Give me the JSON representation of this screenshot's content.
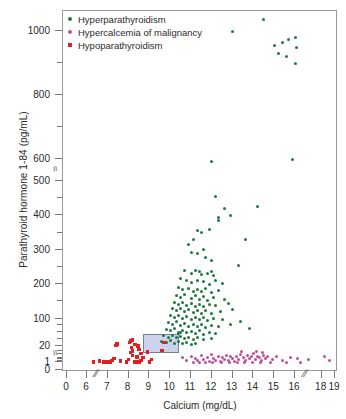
{
  "chart_data": {
    "type": "scatter",
    "title": "",
    "xlabel": "Calcium (mg/dL)",
    "ylabel": "Parathyroid hormone 1-84 (pg/mL)",
    "grid": false,
    "legend_position": "top-left",
    "xlim": [
      0,
      19
    ],
    "ylim": [
      0,
      1000
    ],
    "x_ticklabels": [
      "0",
      "6",
      "7",
      "8",
      "9",
      "10",
      "11",
      "12",
      "13",
      "14",
      "15",
      "16",
      "18",
      "19"
    ],
    "x_tickvalues": [
      0,
      6,
      7,
      8,
      9,
      10,
      11,
      12,
      13,
      14,
      15,
      16,
      18,
      19
    ],
    "x_axis_break_after": 6,
    "x_axis_break_after_2": 16,
    "y_ticklabels": [
      "1000",
      "800",
      "600",
      "500",
      "400",
      "300",
      "200",
      "100",
      "20",
      "1",
      "0"
    ],
    "y_tickvalues": [
      1000,
      800,
      600,
      500,
      400,
      300,
      200,
      100,
      20,
      1,
      0
    ],
    "y_axis_break_between": "500-600",
    "y_axis_break_between_2": "1-20",
    "reference_box": {
      "label": "normal reference range",
      "x_range": [
        8.7,
        10.4
      ],
      "y_range": [
        12,
        55
      ],
      "fill": "#ccd2ea",
      "stroke": "#7a7f95"
    },
    "series": [
      {
        "name": "Hyperparathyroidism",
        "color": "#1f7a3d",
        "marker": "circle",
        "points": [
          [
            13.0,
            1000
          ],
          [
            14.5,
            1035
          ],
          [
            15.4,
            965
          ],
          [
            15.6,
            920
          ],
          [
            15.7,
            975
          ],
          [
            15.0,
            955
          ],
          [
            15.2,
            930
          ],
          [
            16.0,
            980
          ],
          [
            16.1,
            950
          ],
          [
            16.0,
            900
          ],
          [
            12.0,
            590
          ],
          [
            15.9,
            600
          ],
          [
            12.2,
            455
          ],
          [
            12.6,
            420
          ],
          [
            12.3,
            395
          ],
          [
            12.3,
            385
          ],
          [
            12.9,
            400
          ],
          [
            14.2,
            425
          ],
          [
            11.3,
            355
          ],
          [
            11.5,
            350
          ],
          [
            11.9,
            360
          ],
          [
            11.1,
            330
          ],
          [
            13.6,
            330
          ],
          [
            10.9,
            315
          ],
          [
            11.0,
            292
          ],
          [
            11.3,
            288
          ],
          [
            11.6,
            300
          ],
          [
            11.7,
            278
          ],
          [
            12.0,
            268
          ],
          [
            13.3,
            255
          ],
          [
            10.7,
            240
          ],
          [
            11.0,
            232
          ],
          [
            11.2,
            240
          ],
          [
            11.4,
            236
          ],
          [
            11.5,
            228
          ],
          [
            11.8,
            230
          ],
          [
            12.0,
            238
          ],
          [
            12.1,
            225
          ],
          [
            10.5,
            215
          ],
          [
            10.8,
            210
          ],
          [
            11.0,
            205
          ],
          [
            11.3,
            212
          ],
          [
            11.6,
            208
          ],
          [
            11.9,
            200
          ],
          [
            12.2,
            210
          ],
          [
            12.5,
            202
          ],
          [
            10.4,
            190
          ],
          [
            10.6,
            185
          ],
          [
            10.9,
            188
          ],
          [
            11.1,
            180
          ],
          [
            11.3,
            184
          ],
          [
            11.5,
            178
          ],
          [
            11.7,
            186
          ],
          [
            12.0,
            176
          ],
          [
            12.3,
            182
          ],
          [
            10.3,
            168
          ],
          [
            10.5,
            162
          ],
          [
            10.7,
            170
          ],
          [
            11.0,
            158
          ],
          [
            11.2,
            166
          ],
          [
            11.4,
            155
          ],
          [
            11.6,
            164
          ],
          [
            11.8,
            152
          ],
          [
            12.1,
            160
          ],
          [
            12.6,
            156
          ],
          [
            10.2,
            148
          ],
          [
            10.4,
            142
          ],
          [
            10.6,
            146
          ],
          [
            10.8,
            138
          ],
          [
            11.0,
            144
          ],
          [
            11.2,
            136
          ],
          [
            11.4,
            140
          ],
          [
            11.6,
            134
          ],
          [
            11.9,
            142
          ],
          [
            12.2,
            138
          ],
          [
            12.8,
            145
          ],
          [
            10.1,
            128
          ],
          [
            10.3,
            124
          ],
          [
            10.5,
            130
          ],
          [
            10.7,
            120
          ],
          [
            10.9,
            126
          ],
          [
            11.1,
            118
          ],
          [
            11.3,
            122
          ],
          [
            11.5,
            116
          ],
          [
            11.7,
            124
          ],
          [
            12.0,
            114
          ],
          [
            12.4,
            120
          ],
          [
            13.0,
            126
          ],
          [
            10.0,
            108
          ],
          [
            10.2,
            104
          ],
          [
            10.4,
            110
          ],
          [
            10.6,
            100
          ],
          [
            10.8,
            106
          ],
          [
            11.0,
            98
          ],
          [
            11.2,
            102
          ],
          [
            11.4,
            96
          ],
          [
            11.6,
            104
          ],
          [
            11.8,
            94
          ],
          [
            12.1,
            100
          ],
          [
            12.5,
            96
          ],
          [
            9.9,
            88
          ],
          [
            10.1,
            84
          ],
          [
            10.3,
            90
          ],
          [
            10.5,
            80
          ],
          [
            10.7,
            86
          ],
          [
            10.9,
            78
          ],
          [
            11.1,
            82
          ],
          [
            11.3,
            76
          ],
          [
            11.5,
            84
          ],
          [
            11.7,
            74
          ],
          [
            12.0,
            80
          ],
          [
            12.3,
            76
          ],
          [
            12.9,
            82
          ],
          [
            9.8,
            68
          ],
          [
            10.0,
            64
          ],
          [
            10.2,
            70
          ],
          [
            10.4,
            60
          ],
          [
            10.6,
            66
          ],
          [
            10.8,
            58
          ],
          [
            11.0,
            62
          ],
          [
            11.2,
            56
          ],
          [
            11.4,
            64
          ],
          [
            11.6,
            54
          ],
          [
            11.9,
            60
          ],
          [
            12.2,
            56
          ],
          [
            9.7,
            50
          ],
          [
            9.9,
            46
          ],
          [
            10.1,
            52
          ],
          [
            10.3,
            44
          ],
          [
            10.5,
            48
          ],
          [
            10.7,
            42
          ],
          [
            10.9,
            46
          ],
          [
            11.1,
            40
          ],
          [
            11.3,
            44
          ],
          [
            11.6,
            38
          ],
          [
            12.0,
            42
          ],
          [
            9.6,
            34
          ],
          [
            9.8,
            30
          ],
          [
            10.0,
            36
          ],
          [
            10.2,
            28
          ],
          [
            10.4,
            32
          ],
          [
            10.6,
            26
          ],
          [
            10.8,
            30
          ],
          [
            11.0,
            24
          ],
          [
            11.2,
            28
          ],
          [
            10.4,
            56
          ],
          [
            10.5,
            58
          ],
          [
            13.4,
            90
          ],
          [
            13.8,
            70
          ]
        ]
      },
      {
        "name": "Hypercalcemia of malignancy",
        "color": "#c0509a",
        "marker": "circle",
        "points": [
          [
            11.0,
            8
          ],
          [
            11.2,
            5
          ],
          [
            11.3,
            3
          ],
          [
            11.5,
            9
          ],
          [
            11.6,
            4
          ],
          [
            11.8,
            6
          ],
          [
            11.9,
            2
          ],
          [
            12.0,
            10
          ],
          [
            12.1,
            5
          ],
          [
            12.2,
            3
          ],
          [
            12.3,
            8
          ],
          [
            12.4,
            2
          ],
          [
            12.5,
            6
          ],
          [
            12.6,
            4
          ],
          [
            12.7,
            9
          ],
          [
            12.8,
            3
          ],
          [
            12.9,
            7
          ],
          [
            13.0,
            5
          ],
          [
            13.1,
            2
          ],
          [
            13.2,
            8
          ],
          [
            13.3,
            4
          ],
          [
            13.4,
            10
          ],
          [
            13.5,
            6
          ],
          [
            13.6,
            3
          ],
          [
            13.7,
            9
          ],
          [
            13.8,
            5
          ],
          [
            13.9,
            7
          ],
          [
            14.0,
            11
          ],
          [
            14.1,
            4
          ],
          [
            14.2,
            8
          ],
          [
            14.3,
            6
          ],
          [
            14.4,
            3
          ],
          [
            14.5,
            9
          ],
          [
            14.6,
            5
          ],
          [
            14.7,
            7
          ],
          [
            14.9,
            4
          ],
          [
            15.1,
            8
          ],
          [
            15.4,
            3
          ],
          [
            15.8,
            6
          ],
          [
            16.2,
            5
          ],
          [
            17.0,
            4
          ],
          [
            18.2,
            7
          ],
          [
            18.6,
            3
          ],
          [
            11.1,
            1
          ],
          [
            11.4,
            1
          ],
          [
            11.7,
            1
          ],
          [
            12.05,
            1
          ],
          [
            12.45,
            1
          ],
          [
            12.85,
            1
          ],
          [
            13.25,
            1
          ],
          [
            13.55,
            1
          ],
          [
            13.95,
            1
          ],
          [
            14.35,
            1
          ],
          [
            14.8,
            1
          ],
          [
            15.6,
            1
          ],
          [
            16.4,
            1
          ],
          [
            10.6,
            6
          ],
          [
            10.8,
            3
          ],
          [
            13.45,
            13
          ],
          [
            14.15,
            14
          ],
          [
            14.45,
            12
          ]
        ]
      },
      {
        "name": "Hypoparathyroidism",
        "color": "#e02020",
        "marker": "square",
        "points": [
          [
            6.3,
            1
          ],
          [
            6.8,
            1
          ],
          [
            7.0,
            1
          ],
          [
            7.1,
            1
          ],
          [
            6.9,
            1
          ],
          [
            7.9,
            1
          ],
          [
            8.3,
            1
          ],
          [
            8.5,
            1
          ],
          [
            9.0,
            1
          ],
          [
            7.2,
            3
          ],
          [
            7.3,
            5
          ],
          [
            8.0,
            4
          ],
          [
            8.4,
            7
          ],
          [
            8.6,
            3
          ],
          [
            8.1,
            12
          ],
          [
            8.2,
            14
          ],
          [
            8.15,
            18
          ],
          [
            8.2,
            9
          ],
          [
            8.5,
            16
          ],
          [
            8.6,
            11
          ],
          [
            8.9,
            13
          ],
          [
            7.4,
            22
          ],
          [
            7.45,
            26
          ],
          [
            8.3,
            24
          ],
          [
            8.45,
            20
          ],
          [
            9.6,
            15
          ],
          [
            9.7,
            30
          ],
          [
            6.6,
            2
          ],
          [
            7.6,
            2
          ],
          [
            8.05,
            30
          ],
          [
            8.1,
            34
          ],
          [
            8.2,
            38
          ],
          [
            8.7,
            6
          ],
          [
            9.1,
            4
          ]
        ]
      }
    ]
  },
  "legend": {
    "entries": [
      {
        "label": "Hyperparathyroidism",
        "color": "#1f7a3d",
        "marker": "circle"
      },
      {
        "label": "Hypercalcemia of malignancy",
        "color": "#c0509a",
        "marker": "circle"
      },
      {
        "label": "Hypoparathyroidism",
        "color": "#e02020",
        "marker": "square"
      }
    ]
  }
}
